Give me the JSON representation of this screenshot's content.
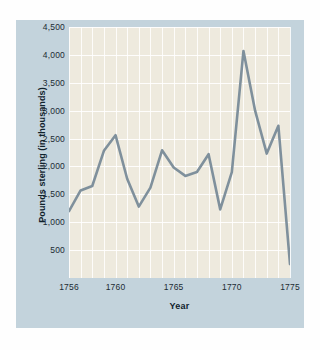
{
  "figure": {
    "background_color": "#c3d3dc",
    "plot_background_color": "#eeeade",
    "line_color": "#7f909c",
    "gridline_color": "#ffffff",
    "text_color": "#1c2b33"
  },
  "chart_data": {
    "type": "line",
    "title": "",
    "xlabel": "Year",
    "ylabel": "Pounds sterling (in thousands)",
    "x": [
      1756,
      1757,
      1758,
      1759,
      1760,
      1761,
      1762,
      1763,
      1764,
      1765,
      1766,
      1767,
      1768,
      1769,
      1770,
      1771,
      1772,
      1773,
      1774,
      1775
    ],
    "values": [
      1200,
      1570,
      1650,
      2280,
      2560,
      1780,
      1280,
      1620,
      2290,
      1980,
      1830,
      1900,
      2220,
      1230,
      1900,
      4070,
      3000,
      2230,
      2730,
      250
    ],
    "series": [
      {
        "name": "Pounds sterling",
        "values": [
          1200,
          1570,
          1650,
          2280,
          2560,
          1780,
          1280,
          1620,
          2290,
          1980,
          1830,
          1900,
          2220,
          1230,
          1900,
          4070,
          3000,
          2230,
          2730,
          250
        ]
      }
    ],
    "xlim": [
      1756,
      1775
    ],
    "ylim": [
      0,
      4500
    ],
    "ytick_labels": [
      "4,500",
      "4,000",
      "3,500",
      "3,000",
      "2,500",
      "2,000",
      "1,500",
      "1,000",
      "500"
    ],
    "ytick_values": [
      4500,
      4000,
      3500,
      3000,
      2500,
      2000,
      1500,
      1000,
      500
    ],
    "xtick_labels": [
      "1756",
      "1760",
      "1765",
      "1770",
      "1775"
    ],
    "xtick_values": [
      1756,
      1760,
      1765,
      1770,
      1775
    ],
    "grid": true,
    "legend": "none"
  }
}
